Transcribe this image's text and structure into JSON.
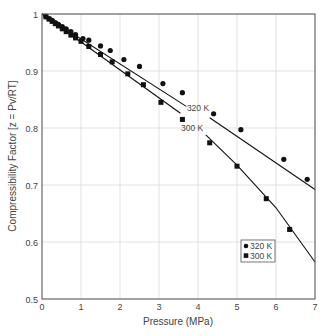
{
  "chart_data": {
    "type": "scatter",
    "title": "",
    "xlabel": "Pressure (MPa)",
    "ylabel": "Compressibility Factor [z = Pv/RT]",
    "xlim": [
      0,
      7
    ],
    "ylim": [
      0.5,
      1
    ],
    "xticks": [
      0,
      1,
      2,
      3,
      4,
      5,
      6,
      7
    ],
    "xtick_labels": [
      "0",
      "1",
      "2",
      "3",
      "4",
      "5",
      "6",
      "7"
    ],
    "yticks": [
      0.5,
      0.6,
      0.7,
      0.8,
      0.9,
      1.0
    ],
    "ytick_labels": [
      "0.5",
      "0.6",
      "0.7",
      "0.8",
      "0.9",
      "1"
    ],
    "grid": true,
    "legend_position": "lower right",
    "series": [
      {
        "name": "320 K",
        "marker": "circle",
        "annotation": "320 K",
        "points": [
          [
            0.1,
            0.996
          ],
          [
            0.18,
            0.992
          ],
          [
            0.26,
            0.989
          ],
          [
            0.34,
            0.985
          ],
          [
            0.42,
            0.982
          ],
          [
            0.52,
            0.978
          ],
          [
            0.62,
            0.974
          ],
          [
            0.74,
            0.969
          ],
          [
            0.86,
            0.964
          ],
          [
            1.05,
            0.957
          ],
          [
            1.2,
            0.954
          ],
          [
            1.5,
            0.944
          ],
          [
            1.75,
            0.936
          ],
          [
            2.1,
            0.92
          ],
          [
            2.5,
            0.908
          ],
          [
            3.1,
            0.878
          ],
          [
            3.6,
            0.862
          ],
          [
            4.4,
            0.825
          ],
          [
            5.1,
            0.797
          ],
          [
            6.2,
            0.745
          ],
          [
            6.8,
            0.71
          ]
        ],
        "fit_line": [
          [
            0,
            1.0
          ],
          [
            3.7,
            0.838
          ],
          [
            4.3,
            0.818
          ],
          [
            7,
            0.692
          ]
        ]
      },
      {
        "name": "300 K",
        "marker": "square",
        "annotation": "300 K",
        "points": [
          [
            0.1,
            0.995
          ],
          [
            0.18,
            0.991
          ],
          [
            0.26,
            0.987
          ],
          [
            0.34,
            0.983
          ],
          [
            0.42,
            0.979
          ],
          [
            0.52,
            0.974
          ],
          [
            0.62,
            0.969
          ],
          [
            0.74,
            0.963
          ],
          [
            0.86,
            0.958
          ],
          [
            1.0,
            0.952
          ],
          [
            1.2,
            0.943
          ],
          [
            1.5,
            0.929
          ],
          [
            1.8,
            0.916
          ],
          [
            2.2,
            0.895
          ],
          [
            2.6,
            0.876
          ],
          [
            3.05,
            0.845
          ],
          [
            3.6,
            0.815
          ],
          [
            4.3,
            0.774
          ],
          [
            5.0,
            0.733
          ],
          [
            5.75,
            0.676
          ],
          [
            6.35,
            0.622
          ]
        ],
        "fit_line": [
          [
            0,
            1.0
          ],
          [
            3.55,
            0.826
          ],
          [
            4.2,
            0.788
          ],
          [
            5.0,
            0.735
          ],
          [
            6.0,
            0.66
          ],
          [
            7,
            0.565
          ]
        ]
      }
    ],
    "label_positions": {
      "320 K": [
        4.0,
        0.835
      ],
      "300 K": [
        3.85,
        0.8
      ]
    }
  },
  "axes": {
    "x_label": "Pressure (MPa)",
    "y_label": "Compressibility Factor [z = Pv/RT]"
  },
  "legend": {
    "items": [
      {
        "label": "320 K",
        "marker": "circle"
      },
      {
        "label": "300 K",
        "marker": "square"
      }
    ]
  },
  "colors": {
    "axis": "#555555",
    "grid": "#d9d9d9",
    "data": "#111111",
    "text": "#444444"
  }
}
